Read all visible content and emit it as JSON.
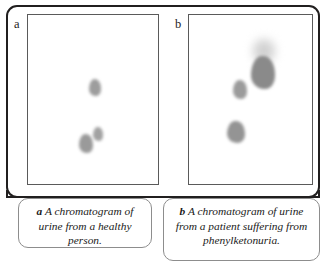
{
  "figure": {
    "kind": "two-panel-chromatogram-figure",
    "panels": [
      {
        "id": "a",
        "label": "a",
        "spots": [
          {
            "name": "spot-upper",
            "x": 88,
            "y": 78,
            "w": 12,
            "h": 17,
            "color": "#9d9d9d",
            "blur": "normal"
          },
          {
            "name": "spot-lower-right",
            "x": 92,
            "y": 126,
            "w": 10,
            "h": 14,
            "color": "#a2a2a2",
            "blur": "normal"
          },
          {
            "name": "spot-lower-left",
            "x": 78,
            "y": 133,
            "w": 14,
            "h": 19,
            "color": "#9a9a9a",
            "blur": "normal"
          }
        ]
      },
      {
        "id": "b",
        "label": "b",
        "spots": [
          {
            "name": "spot-streak",
            "x": 252,
            "y": 40,
            "w": 22,
            "h": 22,
            "color": "#cfcfcf",
            "blur": "streak"
          },
          {
            "name": "spot-large-dark",
            "x": 250,
            "y": 55,
            "w": 24,
            "h": 33,
            "color": "#8a8a8a",
            "blur": "normal"
          },
          {
            "name": "spot-middle",
            "x": 232,
            "y": 79,
            "w": 14,
            "h": 19,
            "color": "#9b9b9b",
            "blur": "normal"
          },
          {
            "name": "spot-lower",
            "x": 226,
            "y": 120,
            "w": 18,
            "h": 22,
            "color": "#949494",
            "blur": "normal"
          }
        ]
      }
    ],
    "captions": [
      {
        "id": "a",
        "letter": "a",
        "text": "A chromatogram of urine from a healthy person."
      },
      {
        "id": "b",
        "letter": "b",
        "text": "A chromatogram of urine from a patient suffering from phenylketonuria."
      }
    ],
    "colors": {
      "frame": "#211f1f",
      "panel_border": "#5a5a5a",
      "caption_border": "#8d8d8d",
      "text": "#1a1a1a",
      "background": "#ffffff",
      "spot_dark": "#8a8a8a",
      "spot_light": "#cfcfcf"
    }
  }
}
